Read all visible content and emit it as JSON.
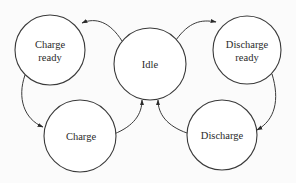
{
  "diagram": {
    "type": "state-machine",
    "colors": {
      "stroke": "#3a3a3a",
      "text": "#2a2a2a",
      "fill": "#ffffff",
      "background": "#fbfbfb"
    },
    "nodes": [
      {
        "id": "charge_ready",
        "lines": [
          "Charge",
          "ready"
        ],
        "cx": 50,
        "cy": 50,
        "r": 35
      },
      {
        "id": "idle",
        "lines": [
          "Idle"
        ],
        "cx": 150,
        "cy": 64,
        "r": 36
      },
      {
        "id": "discharge_ready",
        "lines": [
          "Discharge",
          "ready"
        ],
        "cx": 247,
        "cy": 50,
        "r": 34
      },
      {
        "id": "charge",
        "lines": [
          "Charge"
        ],
        "cx": 80,
        "cy": 136,
        "r": 36
      },
      {
        "id": "discharge",
        "lines": [
          "Discharge"
        ],
        "cx": 222,
        "cy": 135,
        "r": 35
      }
    ],
    "edges": [
      {
        "from": "idle",
        "to": "charge_ready"
      },
      {
        "from": "idle",
        "to": "discharge_ready"
      },
      {
        "from": "charge_ready",
        "to": "charge"
      },
      {
        "from": "discharge_ready",
        "to": "discharge"
      },
      {
        "from": "charge",
        "to": "idle"
      },
      {
        "from": "discharge",
        "to": "idle"
      }
    ]
  }
}
